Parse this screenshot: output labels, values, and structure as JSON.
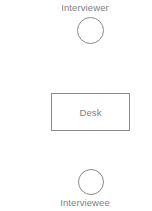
{
  "diagram": {
    "type": "interview-room-layout",
    "background_color": "#ffffff",
    "line_color": "#8a8a89",
    "text_color": "#80807f",
    "nodes": [
      {
        "id": "interviewer",
        "shape": "circle",
        "label": "Interviewer",
        "label_position": "above"
      },
      {
        "id": "desk",
        "shape": "rectangle",
        "label": "Desk",
        "label_position": "inside"
      },
      {
        "id": "interviewee",
        "shape": "circle",
        "label": "Interviewee",
        "label_position": "below"
      }
    ],
    "labels": {
      "interviewer": "Interviewer",
      "desk": "Desk",
      "interviewee": "Interviewee"
    }
  }
}
